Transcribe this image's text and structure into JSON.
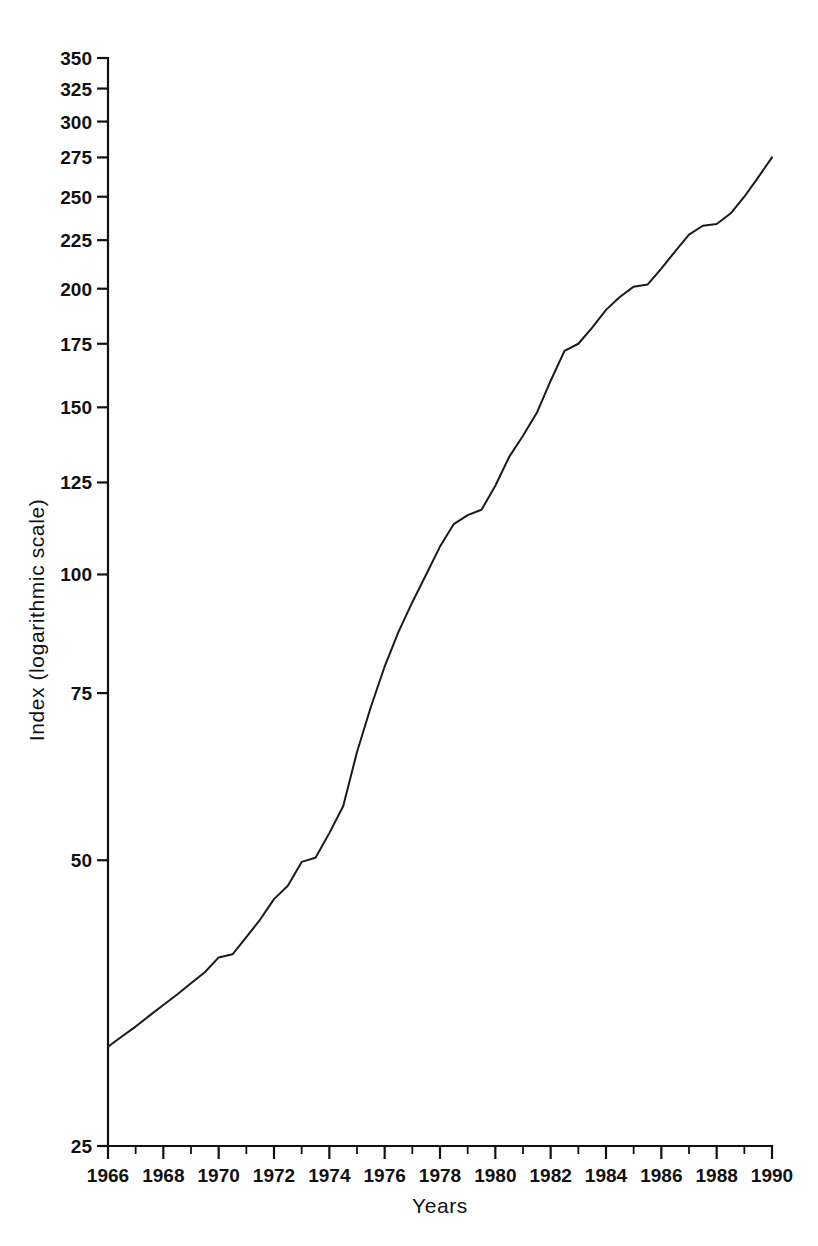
{
  "chart_data": {
    "type": "line",
    "title": "",
    "subtitle": "",
    "xlabel": "Years",
    "ylabel": "Index (logarithmic scale)",
    "yscale": "log",
    "ylim": [
      25,
      350
    ],
    "xlim": [
      1966,
      1990
    ],
    "grid": false,
    "legend": null,
    "y_ticks": [
      25,
      50,
      75,
      100,
      125,
      150,
      175,
      200,
      225,
      250,
      275,
      300,
      325,
      350
    ],
    "y_tick_labels": [
      "25",
      "50",
      "75",
      "100",
      "125",
      "150",
      "175",
      "200",
      "225",
      "250",
      "275",
      "300",
      "325",
      "350"
    ],
    "x_ticks": [
      1966,
      1968,
      1970,
      1972,
      1974,
      1976,
      1978,
      1980,
      1982,
      1984,
      1986,
      1988,
      1990
    ],
    "x_tick_labels": [
      "1966",
      "1968",
      "1970",
      "1972",
      "1974",
      "1976",
      "1978",
      "1980",
      "1982",
      "1984",
      "1986",
      "1988",
      "1990"
    ],
    "x_minor_ticks": [
      1967,
      1969,
      1971,
      1973,
      1975,
      1977,
      1979,
      1981,
      1983,
      1985,
      1987,
      1989
    ],
    "series": [
      {
        "name": "Index",
        "color": "#1a1a1a",
        "x": [
          1966.0,
          1966.5,
          1967.0,
          1967.5,
          1968.0,
          1968.5,
          1969.0,
          1969.5,
          1970.0,
          1970.5,
          1971.0,
          1971.5,
          1972.0,
          1972.5,
          1973.0,
          1973.5,
          1974.0,
          1974.5,
          1975.0,
          1975.5,
          1976.0,
          1976.5,
          1977.0,
          1977.5,
          1978.0,
          1978.5,
          1979.0,
          1979.5,
          1980.0,
          1980.5,
          1981.0,
          1981.5,
          1982.0,
          1982.5,
          1983.0,
          1983.5,
          1984.0,
          1984.5,
          1985.0,
          1985.5,
          1986.0,
          1986.5,
          1987.0,
          1987.5,
          1988.0,
          1988.5,
          1989.0,
          1989.5,
          1990.0
        ],
        "values": [
          31.8,
          32.6,
          33.4,
          34.3,
          35.2,
          36.1,
          37.1,
          38.1,
          39.5,
          39.8,
          41.5,
          43.3,
          45.5,
          47.0,
          49.8,
          50.3,
          53.4,
          57.0,
          65.0,
          72.5,
          80.0,
          87.0,
          93.5,
          100.0,
          107.0,
          113.0,
          115.5,
          117.0,
          124.0,
          133.0,
          140.0,
          148.0,
          160.0,
          172.0,
          175.0,
          182.0,
          190.0,
          196.0,
          201.0,
          202.0,
          210.0,
          219.0,
          228.0,
          233.0,
          234.0,
          240.0,
          250.0,
          262.0,
          275.0
        ]
      }
    ]
  },
  "axes": {
    "y_axis_title": "Index (logarithmic scale)",
    "x_axis_title": "Years"
  }
}
